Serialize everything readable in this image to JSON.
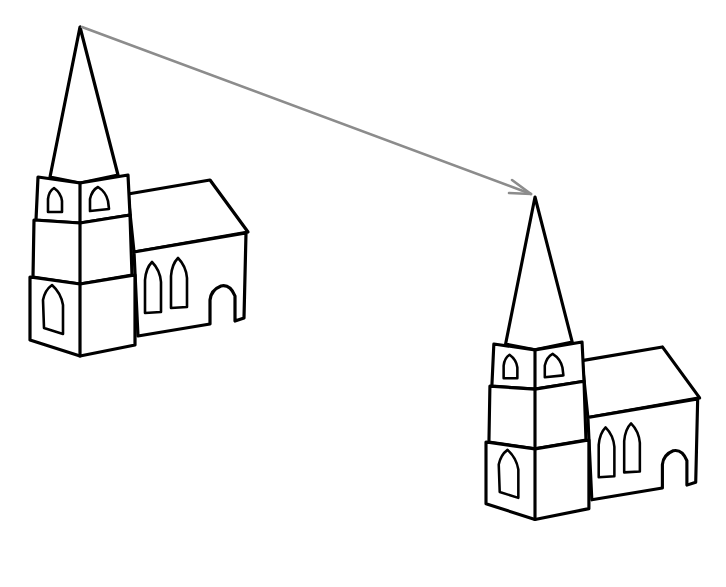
{
  "figure": {
    "background_color": "#ffffff",
    "ink_color": "#000000",
    "arrow_color": "#8c8c8c"
  },
  "churches": [
    {
      "id": "church-left",
      "spire_tip": [
        80,
        27
      ]
    },
    {
      "id": "church-right",
      "spire_tip": [
        535,
        197
      ]
    }
  ],
  "arrow": {
    "from": [
      80,
      27
    ],
    "to": [
      533,
      195
    ]
  }
}
